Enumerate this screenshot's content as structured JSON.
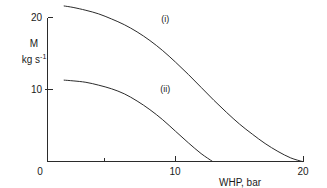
{
  "chart_data": {
    "type": "line",
    "title": "",
    "subtitle": "",
    "xlabel": "WHP, bar",
    "ylabel_line1": "M",
    "ylabel_line2_base": "kg s",
    "ylabel_line2_exp": "-1",
    "ylabel_full": "M, kg s-1",
    "xlim": [
      0,
      20
    ],
    "ylim": [
      0,
      22.5
    ],
    "grid": false,
    "legend_position": "inline-annotation",
    "x_ticks": [
      {
        "value": 0,
        "label": "0",
        "major": true
      },
      {
        "value": 5,
        "label": "",
        "major": false
      },
      {
        "value": 10,
        "label": "10",
        "major": true
      },
      {
        "value": 20,
        "label": "20",
        "major": true
      }
    ],
    "y_ticks": [
      {
        "value": 0,
        "label": "",
        "major": true
      },
      {
        "value": 10,
        "label": "10",
        "major": true
      },
      {
        "value": 20,
        "label": "20",
        "major": true
      }
    ],
    "origin_label": "0",
    "series": [
      {
        "name": "(i)",
        "annotation": "(i)",
        "annotation_at": {
          "x": 9.2,
          "y": 19.4
        },
        "x": [
          1.3,
          2,
          3,
          4,
          5,
          6,
          7,
          8,
          9,
          10,
          11,
          12,
          13,
          14,
          15,
          16,
          17,
          18,
          19,
          19.9
        ],
        "values": [
          21.6,
          21.4,
          21.0,
          20.5,
          19.8,
          19.0,
          18.0,
          16.8,
          15.4,
          13.8,
          12.1,
          10.3,
          8.5,
          6.8,
          5.2,
          3.8,
          2.5,
          1.4,
          0.5,
          0.0
        ]
      },
      {
        "name": "(ii)",
        "annotation": "(ii)",
        "annotation_at": {
          "x": 9.2,
          "y": 9.6
        },
        "x": [
          1.3,
          2,
          3,
          4,
          5,
          6,
          7,
          8,
          9,
          10,
          11,
          12,
          12.9
        ],
        "values": [
          11.3,
          11.2,
          11.0,
          10.6,
          10.1,
          9.4,
          8.4,
          7.2,
          5.8,
          4.2,
          2.6,
          1.1,
          0.0
        ]
      }
    ],
    "colors": {
      "axis": "#2b2b2b",
      "curve": "#2b2b2b",
      "background": "#ffffff",
      "text": "#1a1a1a"
    }
  }
}
